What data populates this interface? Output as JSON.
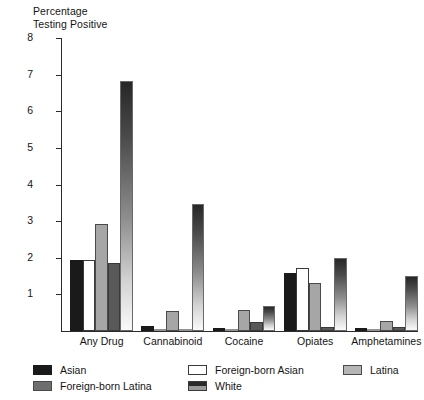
{
  "chart_data": {
    "type": "bar",
    "title": "",
    "ylabel": "Percentage\nTesting Positive",
    "xlabel": "",
    "ylim": [
      0,
      8
    ],
    "yticks": [
      1,
      2,
      3,
      4,
      5,
      6,
      7,
      8
    ],
    "ytick_labels": [
      "1",
      "2",
      "3",
      "4",
      "5",
      "6",
      "7",
      "8"
    ],
    "grid": false,
    "legend_position": "below-axis",
    "categories": [
      "Any Drug",
      "Cannabinoid",
      "Cocaine",
      "Opiates",
      "Amphetamines"
    ],
    "series": [
      {
        "name": "Asian",
        "style": "solid-black",
        "color": "#1a1a1a",
        "values": [
          1.95,
          0.15,
          0.08,
          1.58,
          0.08
        ]
      },
      {
        "name": "Foreign-born Asian",
        "style": "solid-white",
        "color": "#ffffff",
        "values": [
          1.93,
          0.0,
          0.0,
          1.72,
          0.0
        ]
      },
      {
        "name": "Latina",
        "style": "solid-lightgray",
        "color": "#a6a6a6",
        "values": [
          2.91,
          0.55,
          0.57,
          1.31,
          0.28
        ]
      },
      {
        "name": "White",
        "style": "solid-darkgray",
        "color": "#595959",
        "values": [
          1.85,
          0.0,
          0.25,
          0.12,
          0.1
        ]
      },
      {
        "name": "Foreign-born Latina",
        "style": "gradient",
        "color": "#6e6e6e",
        "values": [
          6.83,
          3.47,
          0.67,
          2.0,
          1.51
        ]
      }
    ]
  },
  "axis": {
    "y_title_line1": "Percentage",
    "y_title_line2": "Testing Positive"
  },
  "legend": {
    "items": [
      {
        "key": "asian",
        "label": "Asian",
        "swatch": "s-asian"
      },
      {
        "key": "fb-latina",
        "label": "Foreign-born Latina",
        "swatch": "s-fb-latina"
      },
      {
        "key": "fb-asian",
        "label": "Foreign-born Asian",
        "swatch": "s-fb-asian"
      },
      {
        "key": "white",
        "label": "White",
        "swatch": "s-white"
      },
      {
        "key": "latina",
        "label": "Latina",
        "swatch": "s-latina"
      }
    ]
  }
}
